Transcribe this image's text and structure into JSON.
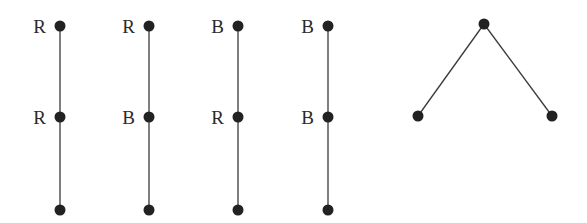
{
  "diagram": {
    "type": "graphs",
    "paths": [
      {
        "id": "path-1",
        "x": 60,
        "nodes": [
          {
            "y": 26,
            "label": "R"
          },
          {
            "y": 117,
            "label": "R"
          },
          {
            "y": 210,
            "label": ""
          }
        ]
      },
      {
        "id": "path-2",
        "x": 149,
        "nodes": [
          {
            "y": 26,
            "label": "R"
          },
          {
            "y": 117,
            "label": "B"
          },
          {
            "y": 210,
            "label": ""
          }
        ]
      },
      {
        "id": "path-3",
        "x": 238,
        "nodes": [
          {
            "y": 26,
            "label": "B"
          },
          {
            "y": 117,
            "label": "R"
          },
          {
            "y": 210,
            "label": ""
          }
        ]
      },
      {
        "id": "path-4",
        "x": 328,
        "nodes": [
          {
            "y": 26,
            "label": "B"
          },
          {
            "y": 117,
            "label": "B"
          },
          {
            "y": 210,
            "label": ""
          }
        ]
      }
    ],
    "tree": {
      "id": "star-tree",
      "nodes": [
        {
          "x": 484,
          "y": 24
        },
        {
          "x": 418,
          "y": 116
        },
        {
          "x": 552,
          "y": 116
        }
      ],
      "edges": [
        [
          0,
          1
        ],
        [
          0,
          2
        ]
      ]
    },
    "colors": {
      "node": "#222222",
      "edge": "#3a3a3a",
      "label": "#2a2a2a"
    }
  }
}
